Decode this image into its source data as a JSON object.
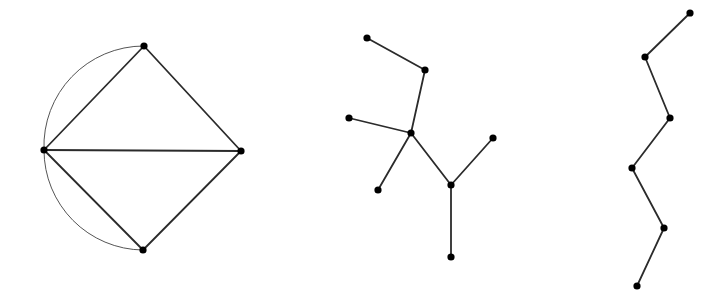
{
  "canvas": {
    "width": 719,
    "height": 295,
    "background": "#ffffff"
  },
  "colors": {
    "edge": "#2b2b2b",
    "arc": "#555555",
    "node": "#000000"
  },
  "graphs": [
    {
      "name": "multigraph-diamond",
      "nodes": [
        {
          "id": "top",
          "x": 144,
          "y": 46
        },
        {
          "id": "left",
          "x": 44,
          "y": 150
        },
        {
          "id": "right",
          "x": 241,
          "y": 151
        },
        {
          "id": "bottom",
          "x": 143,
          "y": 250
        }
      ],
      "edges": [
        [
          "top",
          "left"
        ],
        [
          "top",
          "right"
        ],
        [
          "left",
          "right"
        ],
        [
          "left",
          "bottom"
        ],
        [
          "right",
          "bottom"
        ]
      ],
      "curved_edges": [
        [
          "top",
          "left"
        ],
        [
          "left",
          "bottom"
        ]
      ]
    },
    {
      "name": "tree",
      "nodes": [
        {
          "id": "a",
          "x": 367,
          "y": 38
        },
        {
          "id": "b",
          "x": 425,
          "y": 70
        },
        {
          "id": "c",
          "x": 411,
          "y": 133
        },
        {
          "id": "d",
          "x": 349,
          "y": 118
        },
        {
          "id": "e",
          "x": 378,
          "y": 190
        },
        {
          "id": "f",
          "x": 451,
          "y": 185
        },
        {
          "id": "g",
          "x": 493,
          "y": 138
        },
        {
          "id": "h",
          "x": 451,
          "y": 257
        }
      ],
      "edges": [
        [
          "a",
          "b"
        ],
        [
          "b",
          "c"
        ],
        [
          "d",
          "c"
        ],
        [
          "c",
          "e"
        ],
        [
          "c",
          "f"
        ],
        [
          "f",
          "g"
        ],
        [
          "f",
          "h"
        ]
      ]
    },
    {
      "name": "path",
      "nodes": [
        {
          "id": "p1",
          "x": 690,
          "y": 13
        },
        {
          "id": "p2",
          "x": 645,
          "y": 57
        },
        {
          "id": "p3",
          "x": 670,
          "y": 118
        },
        {
          "id": "p4",
          "x": 632,
          "y": 168
        },
        {
          "id": "p5",
          "x": 664,
          "y": 228
        },
        {
          "id": "p6",
          "x": 637,
          "y": 286
        }
      ],
      "edges": [
        [
          "p1",
          "p2"
        ],
        [
          "p2",
          "p3"
        ],
        [
          "p3",
          "p4"
        ],
        [
          "p4",
          "p5"
        ],
        [
          "p5",
          "p6"
        ]
      ]
    }
  ]
}
